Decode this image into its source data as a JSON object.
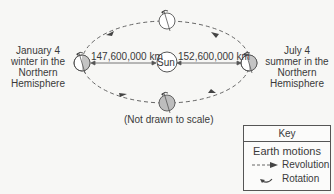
{
  "diagram": {
    "sun_label": "Sun",
    "left_position": {
      "lines": [
        "January 4",
        "winter in the",
        "Northern",
        "Hemisphere"
      ],
      "distance": "147,600,000 km"
    },
    "right_position": {
      "lines": [
        "July 4",
        "summer in the",
        "Northern",
        "Hemisphere"
      ],
      "distance": "152,600,000 km"
    },
    "note": "(Not drawn to scale)",
    "colors": {
      "line": "#555555",
      "earth_shade": "#b8b8b8",
      "background": "#f7f7f5"
    }
  },
  "key": {
    "title": "Key",
    "subtitle": "Earth motions",
    "items": [
      {
        "icon": "dashed-arrow-icon",
        "label": "Revolution"
      },
      {
        "icon": "rotation-arrow-icon",
        "label": "Rotation"
      }
    ]
  }
}
